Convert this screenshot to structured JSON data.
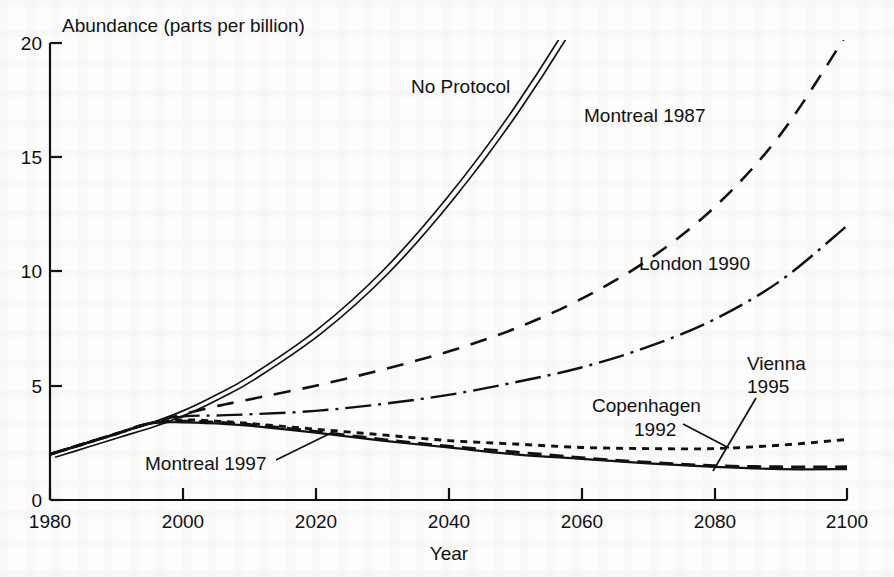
{
  "chart_data": {
    "type": "line",
    "title": "",
    "xlabel": "Year",
    "ylabel": "Abundance (parts per billion)",
    "xlim": [
      1980,
      2100
    ],
    "ylim": [
      0,
      20
    ],
    "xticks": [
      1980,
      2000,
      2020,
      2040,
      2060,
      2080,
      2100
    ],
    "yticks": [
      0,
      5,
      10,
      15,
      20
    ],
    "xtick_labels": [
      "1980",
      "2000",
      "2020",
      "2040",
      "2060",
      "2080",
      "2100"
    ],
    "ytick_labels": [
      "0",
      "5",
      "10",
      "15",
      "20"
    ],
    "grid": false,
    "legend": "inline-labels",
    "x": [
      1980,
      1985,
      1990,
      1995,
      2000,
      2005,
      2010,
      2020,
      2030,
      2040,
      2050,
      2060,
      2070,
      2080,
      2090,
      2100
    ],
    "series": [
      {
        "name": "No Protocol",
        "style": "double-solid",
        "values": [
          2.0,
          2.45,
          2.9,
          3.35,
          3.9,
          4.6,
          5.4,
          7.4,
          10.0,
          13.3,
          17.2,
          21.8,
          27.2,
          33.4,
          40.5,
          48.5
        ]
      },
      {
        "name": "Montreal 1987",
        "style": "long-dash",
        "values": [
          2.0,
          2.45,
          2.9,
          3.35,
          3.75,
          4.1,
          4.4,
          5.0,
          5.7,
          6.5,
          7.5,
          8.8,
          10.5,
          12.8,
          16.0,
          20.4
        ]
      },
      {
        "name": "London 1990",
        "style": "dash-dot",
        "values": [
          2.0,
          2.45,
          2.9,
          3.35,
          3.65,
          3.7,
          3.75,
          3.9,
          4.2,
          4.6,
          5.15,
          5.8,
          6.7,
          7.9,
          9.6,
          12.0
        ]
      },
      {
        "name": "Copenhagen 1992",
        "style": "fine-dash",
        "values": [
          2.0,
          2.45,
          2.9,
          3.35,
          3.5,
          3.45,
          3.35,
          3.1,
          2.85,
          2.6,
          2.45,
          2.3,
          2.25,
          2.25,
          2.4,
          2.65
        ]
      },
      {
        "name": "Vienna 1995",
        "style": "medium-dash",
        "values": [
          2.0,
          2.45,
          2.9,
          3.35,
          3.45,
          3.4,
          3.3,
          3.0,
          2.65,
          2.35,
          2.1,
          1.85,
          1.65,
          1.5,
          1.45,
          1.45
        ]
      },
      {
        "name": "Montreal 1997",
        "style": "solid",
        "values": [
          2.0,
          2.45,
          2.9,
          3.35,
          3.4,
          3.35,
          3.25,
          2.95,
          2.6,
          2.3,
          2.0,
          1.8,
          1.6,
          1.45,
          1.35,
          1.35
        ]
      }
    ],
    "annotations": [
      {
        "name": "no-protocol",
        "text": "No Protocol",
        "leader": false
      },
      {
        "name": "montreal-1987",
        "text": "Montreal 1987",
        "leader": false
      },
      {
        "name": "london-1990",
        "text": "London 1990",
        "leader": false
      },
      {
        "name": "copenhagen-1992",
        "text_line1": "Copenhagen",
        "text_line2": "1992",
        "leader": true
      },
      {
        "name": "vienna-1995",
        "text_line1": "Vienna",
        "text_line2": "1995",
        "leader": true
      },
      {
        "name": "montreal-1997",
        "text": "Montreal 1997",
        "leader": true
      }
    ]
  },
  "axes": {
    "y_axis_title": "Abundance (parts per billion)",
    "x_axis_title": "Year",
    "y_tick_20": "20",
    "y_tick_15": "15",
    "y_tick_10": "10",
    "y_tick_5": "5",
    "y_tick_0": "0",
    "x_tick_1980": "1980",
    "x_tick_2000": "2000",
    "x_tick_2020": "2020",
    "x_tick_2040": "2040",
    "x_tick_2060": "2060",
    "x_tick_2080": "2080",
    "x_tick_2100": "2100"
  },
  "labels": {
    "no_protocol": "No Protocol",
    "montreal_1987": "Montreal 1987",
    "london_1990": "London 1990",
    "copenhagen_line1": "Copenhagen",
    "copenhagen_line2": "1992",
    "vienna_line1": "Vienna",
    "vienna_line2": "1995",
    "montreal_1997": "Montreal 1997"
  },
  "colors": {
    "ink": "#111111",
    "paper": "#fdfdfd"
  }
}
